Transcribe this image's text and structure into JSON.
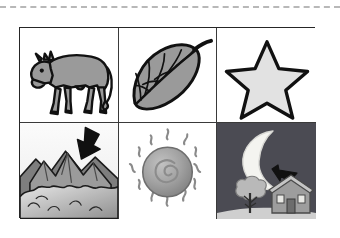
{
  "page": {
    "background_color": "#ffffff",
    "width": 340,
    "height": 238
  },
  "cut_line": {
    "name": "dashed-cut-line",
    "style": "dashed",
    "color": "#b8b8b8"
  },
  "grid": {
    "columns": 3,
    "rows": 2,
    "border_color": "#262626",
    "cells": [
      {
        "id": "cow",
        "label": "cow",
        "row": 1,
        "column": 1,
        "background_color": "#ffffff",
        "fill_color": "#9a9a9a",
        "outline_color": "#111111",
        "has_arrow": false
      },
      {
        "id": "leaf",
        "label": "leaf",
        "row": 1,
        "column": 2,
        "background_color": "#ffffff",
        "fill_color": "#9a9a9a",
        "outline_color": "#111111",
        "has_arrow": false
      },
      {
        "id": "star",
        "label": "star",
        "row": 1,
        "column": 3,
        "background_color": "#ffffff",
        "fill_color": "#e2e2e2",
        "outline_color": "#111111",
        "has_arrow": false
      },
      {
        "id": "mountains",
        "label": "mountains",
        "row": 2,
        "column": 1,
        "background_color": "#f2f2f2",
        "fill_color": "#8d8d8d",
        "outline_color": "#1b1b1b",
        "has_arrow": true,
        "arrow_direction": "down-left",
        "arrow_color": "#111111"
      },
      {
        "id": "sun",
        "label": "sun",
        "row": 2,
        "column": 2,
        "background_color": "#ffffff",
        "fill_color": "#9e9e9e",
        "outline_color": "#6e6e6e",
        "has_arrow": false,
        "ray_count": 12
      },
      {
        "id": "moon-night-scene",
        "label": "moon",
        "row": 2,
        "column": 3,
        "background_color": "#4b4b53",
        "fill_color": "#f4f4f0",
        "outline_color": "#d8d8d4",
        "has_arrow": true,
        "arrow_direction": "up-left",
        "arrow_color": "#111111",
        "scene_items": [
          "moon",
          "tree",
          "house",
          "ground"
        ]
      }
    ]
  }
}
